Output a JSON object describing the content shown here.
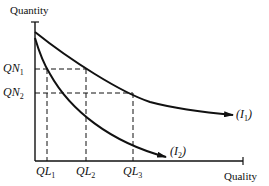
{
  "diagram": {
    "y_axis_label": "Quantity",
    "x_axis_label": "Quality",
    "y_ticks": [
      {
        "base": "QN",
        "sub": "1"
      },
      {
        "base": "QN",
        "sub": "2"
      }
    ],
    "x_ticks": [
      {
        "base": "QL",
        "sub": "1"
      },
      {
        "base": "QL",
        "sub": "2"
      },
      {
        "base": "QL",
        "sub": "3"
      }
    ],
    "curves": [
      {
        "name": "I1",
        "label_open": "(",
        "label_base": "I",
        "label_sub": "1",
        "label_close": ")"
      },
      {
        "name": "I2",
        "label_open": "(",
        "label_base": "I",
        "label_sub": "2",
        "label_close": ")"
      }
    ],
    "colors": {
      "line": "#111111",
      "background": "#ffffff"
    }
  }
}
